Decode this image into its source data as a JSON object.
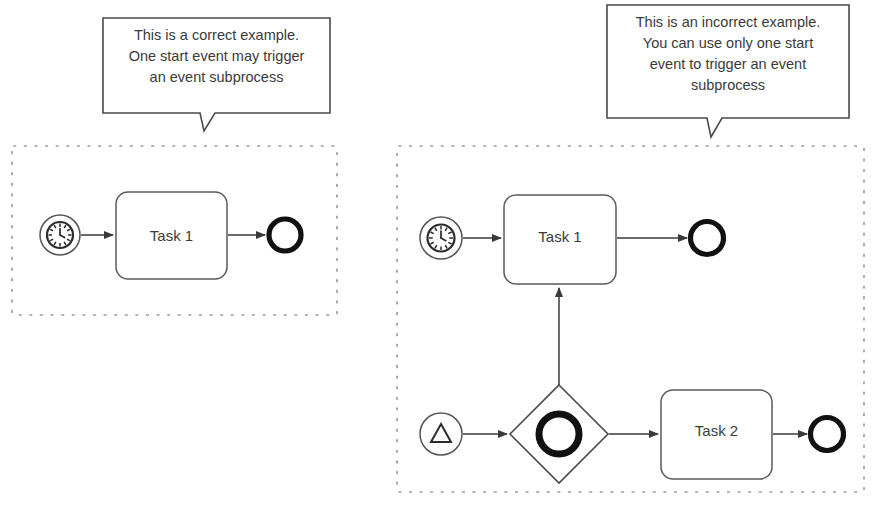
{
  "page": {
    "background_color": "#ffffff",
    "stroke_color": "#3a3a3a",
    "dotted_border_color": "#9a9a9a",
    "thick_event_color": "#1a1a1a"
  },
  "callouts": [
    {
      "id": "correct",
      "name": "correct-example-callout",
      "text": "This is a correct example.\nOne start event may trigger\nan event subprocess",
      "lines": [
        "This is a correct example.",
        "One start event may trigger",
        "an event subprocess"
      ],
      "box": {
        "x": 103,
        "y": 18,
        "width": 227,
        "height": 95
      },
      "tail": {
        "x": 200,
        "y": 113,
        "tip_x": 204,
        "tip_y": 131
      }
    },
    {
      "id": "incorrect",
      "name": "incorrect-example-callout",
      "text": "This is an incorrect example.\nYou can use only one start\nevent to trigger an event\nsubprocess",
      "lines": [
        "This is an incorrect example.",
        "You can use only one start",
        "event to trigger an event",
        "subprocess"
      ],
      "box": {
        "x": 607,
        "y": 5,
        "width": 242,
        "height": 113
      },
      "tail": {
        "x": 707,
        "y": 118,
        "tip_x": 711,
        "tip_y": 137
      }
    }
  ],
  "subprocesses": [
    {
      "id": "left",
      "name": "event-subprocess-correct",
      "border_style": "dotted",
      "box": {
        "x": 12,
        "y": 146,
        "width": 325,
        "height": 169
      },
      "elements": {
        "start_event": {
          "name": "timer-start-event",
          "icon": "timer-clock-icon",
          "cx": 60,
          "cy": 235,
          "r": 20
        },
        "task": {
          "name": "task-1",
          "label": "Task 1",
          "x": 116,
          "y": 192,
          "width": 111,
          "height": 87
        },
        "end_event": {
          "name": "end-event",
          "cx": 285,
          "cy": 235,
          "r": 19
        },
        "flows": [
          {
            "name": "flow-start-to-task-1",
            "from": "timer-start-event",
            "to": "task-1"
          },
          {
            "name": "flow-task-1-to-end",
            "from": "task-1",
            "to": "end-event"
          }
        ]
      }
    },
    {
      "id": "right",
      "name": "event-subprocess-incorrect",
      "border_style": "dotted",
      "box": {
        "x": 397,
        "y": 146,
        "width": 467,
        "height": 346
      },
      "elements": {
        "start_event_timer": {
          "name": "timer-start-event",
          "icon": "timer-clock-icon",
          "cx": 441,
          "cy": 238,
          "r": 21
        },
        "start_event_escalation": {
          "name": "escalation-start-event",
          "icon": "escalation-triangle-icon",
          "cx": 441,
          "cy": 434,
          "r": 21
        },
        "task_1": {
          "name": "task-1",
          "label": "Task 1",
          "x": 504,
          "y": 195,
          "width": 112,
          "height": 89
        },
        "task_2": {
          "name": "task-2",
          "label": "Task 2",
          "x": 661,
          "y": 390,
          "width": 111,
          "height": 89
        },
        "gateway": {
          "name": "event-based-gateway",
          "icon": "event-gateway-circle-icon",
          "cx": 559,
          "cy": 434,
          "half": 49
        },
        "end_event_top": {
          "name": "end-event-top",
          "cx": 707,
          "cy": 238,
          "r": 20
        },
        "end_event_bottom": {
          "name": "end-event-bottom",
          "cx": 827,
          "cy": 434,
          "r": 20
        },
        "flows": [
          {
            "name": "flow-timer-to-task-1",
            "from": "timer-start-event",
            "to": "task-1"
          },
          {
            "name": "flow-task-1-to-end-top",
            "from": "task-1",
            "to": "end-event-top"
          },
          {
            "name": "flow-escalation-to-gateway",
            "from": "escalation-start-event",
            "to": "event-based-gateway"
          },
          {
            "name": "flow-gateway-to-task-1",
            "from": "event-based-gateway",
            "to": "task-1"
          },
          {
            "name": "flow-gateway-to-task-2",
            "from": "event-based-gateway",
            "to": "task-2"
          },
          {
            "name": "flow-task-2-to-end-bottom",
            "from": "task-2",
            "to": "end-event-bottom"
          }
        ]
      }
    }
  ]
}
